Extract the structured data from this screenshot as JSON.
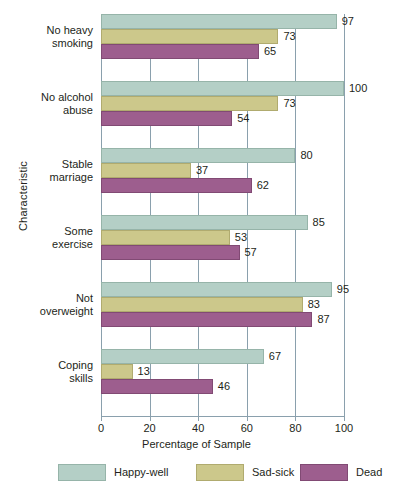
{
  "chart_data": {
    "type": "bar",
    "orientation": "horizontal",
    "title": "",
    "xlabel": "Percentage of Sample",
    "ylabel": "Characteristic",
    "xlim": [
      0,
      100
    ],
    "xticks": [
      0,
      20,
      40,
      60,
      80,
      100
    ],
    "grid": true,
    "legend_position": "bottom",
    "categories": [
      "No heavy smoking",
      "No alcohol abuse",
      "Stable marriage",
      "Some exercise",
      "Not overweight",
      "Coping skills"
    ],
    "category_lines": [
      [
        "No heavy",
        "smoking"
      ],
      [
        "No alcohol",
        "abuse"
      ],
      [
        "Stable",
        "marriage"
      ],
      [
        "Some",
        "exercise"
      ],
      [
        "Not",
        "overweight"
      ],
      [
        "Coping",
        "skills"
      ]
    ],
    "series": [
      {
        "name": "Happy-well",
        "color": "#b4cfc6",
        "values": [
          97,
          100,
          80,
          85,
          95,
          67
        ]
      },
      {
        "name": "Sad-sick",
        "color": "#ccc88b",
        "values": [
          73,
          73,
          37,
          53,
          83,
          13
        ]
      },
      {
        "name": "Dead",
        "color": "#9d5e8e",
        "values": [
          65,
          54,
          62,
          57,
          87,
          46
        ]
      }
    ]
  },
  "legend": {
    "items": [
      {
        "label": "Happy-well"
      },
      {
        "label": "Sad-sick"
      },
      {
        "label": "Dead"
      }
    ]
  }
}
